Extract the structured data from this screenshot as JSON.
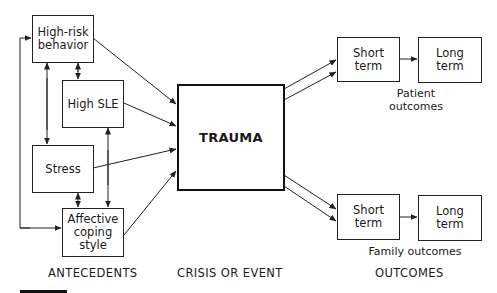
{
  "diagram": {
    "antecedents": {
      "high_risk": "High-risk behavior",
      "high_sle": "High SLE",
      "stress": "Stress",
      "affective": "Affective coping style"
    },
    "event": {
      "trauma": "TRAUMA"
    },
    "outcomes": {
      "patient": {
        "short": "Short term",
        "long": "Long term",
        "label": "Patient outcomes"
      },
      "family": {
        "short": "Short term",
        "long": "Long term",
        "label": "Family outcomes"
      }
    },
    "sections": {
      "antecedents": "ANTECEDENTS",
      "crisis": "CRISIS OR EVENT",
      "outcomes": "OUTCOMES"
    }
  }
}
